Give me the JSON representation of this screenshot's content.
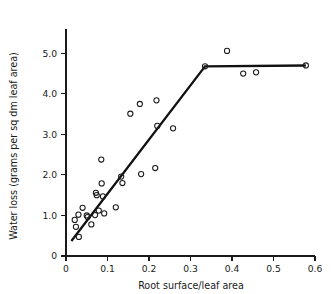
{
  "chart_data": {
    "type": "scatter",
    "title": "",
    "xlabel": "Root surface/leaf area",
    "ylabel": "Water loss (grams per sq dm leaf area)",
    "xlim": [
      0,
      0.6
    ],
    "ylim": [
      0,
      5.6
    ],
    "grid": false,
    "legend": "none",
    "xticks": [
      0,
      0.1,
      0.2,
      0.3,
      0.4,
      0.5,
      0.6
    ],
    "xtick_labels": [
      "0",
      "0.1",
      "0.2",
      "0.3",
      "0.4",
      "0.5",
      "0.6"
    ],
    "yticks": [
      0,
      1.0,
      2.0,
      3.0,
      4.0,
      5.0
    ],
    "ytick_labels": [
      "0",
      "1.0",
      "2.0",
      "3.0",
      "4.0",
      "5.0"
    ],
    "marker_style": "open-circle",
    "series": [
      {
        "name": "observations",
        "points": [
          [
            0.021,
            0.89
          ],
          [
            0.024,
            0.72
          ],
          [
            0.03,
            1.02
          ],
          [
            0.031,
            0.47
          ],
          [
            0.04,
            1.19
          ],
          [
            0.05,
            1.0
          ],
          [
            0.052,
            0.96
          ],
          [
            0.061,
            0.78
          ],
          [
            0.07,
            1.01
          ],
          [
            0.072,
            1.56
          ],
          [
            0.074,
            1.5
          ],
          [
            0.079,
            1.12
          ],
          [
            0.085,
            2.38
          ],
          [
            0.086,
            1.79
          ],
          [
            0.089,
            1.47
          ],
          [
            0.092,
            1.05
          ],
          [
            0.12,
            1.2
          ],
          [
            0.133,
            1.96
          ],
          [
            0.136,
            1.8
          ],
          [
            0.155,
            3.51
          ],
          [
            0.178,
            3.75
          ],
          [
            0.181,
            2.02
          ],
          [
            0.215,
            2.17
          ],
          [
            0.218,
            3.84
          ],
          [
            0.22,
            3.21
          ],
          [
            0.258,
            3.15
          ],
          [
            0.335,
            4.68
          ],
          [
            0.388,
            5.06
          ],
          [
            0.427,
            4.5
          ],
          [
            0.458,
            4.53
          ],
          [
            0.578,
            4.7
          ]
        ]
      }
    ],
    "fit_line": {
      "name": "two-phase linear fit",
      "style": "solid",
      "vertices": [
        [
          0.013,
          0.37
        ],
        [
          0.335,
          4.68
        ],
        [
          0.578,
          4.7
        ]
      ]
    }
  }
}
